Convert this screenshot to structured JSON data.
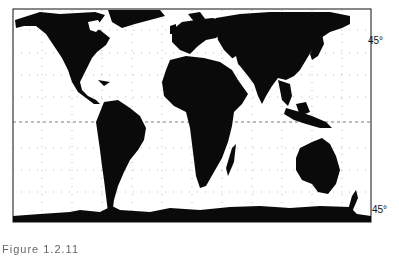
{
  "figure": {
    "type": "world map (equal-area cylindrical projection)",
    "caption": "Figure 1.2.11",
    "colors": {
      "land": "#0a0a0a",
      "ocean": "#ffffff",
      "grid": "#555555"
    }
  },
  "labels": {
    "lat_north": "45°",
    "lat_south": "45°"
  },
  "continents": [
    "North America",
    "South America",
    "Europe",
    "Africa",
    "Asia",
    "Australia",
    "Antarctica",
    "Greenland",
    "Madagascar",
    "New Zealand",
    "Japan",
    "Indonesia"
  ]
}
